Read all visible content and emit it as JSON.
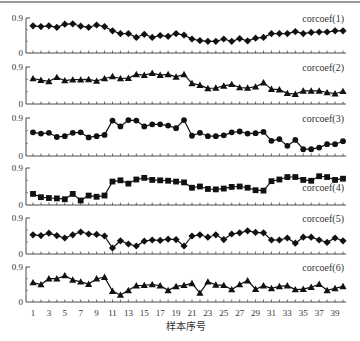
{
  "chart_data": {
    "type": "line",
    "xlabel": "样本序号",
    "x": [
      1,
      2,
      3,
      4,
      5,
      6,
      7,
      8,
      9,
      10,
      11,
      12,
      13,
      14,
      15,
      16,
      17,
      18,
      19,
      20,
      21,
      22,
      23,
      24,
      25,
      26,
      27,
      28,
      29,
      30,
      31,
      32,
      33,
      34,
      35,
      36,
      37,
      38,
      39,
      40
    ],
    "x_tick_labels": [
      "1",
      "3",
      "5",
      "7",
      "9",
      "11",
      "13",
      "15",
      "17",
      "19",
      "21",
      "23",
      "25",
      "27",
      "29",
      "31",
      "33",
      "35",
      "37",
      "39"
    ],
    "ylim": [
      0,
      0.9
    ],
    "y_tick_labels": [
      "0",
      "0.9"
    ],
    "grid": false,
    "layout": "6 stacked panels sharing x-axis",
    "series": [
      {
        "name": "corcoef(1)",
        "marker": "diamond",
        "values": [
          0.7,
          0.68,
          0.7,
          0.66,
          0.74,
          0.75,
          0.69,
          0.66,
          0.72,
          0.68,
          0.57,
          0.5,
          0.5,
          0.4,
          0.48,
          0.4,
          0.45,
          0.43,
          0.5,
          0.46,
          0.36,
          0.32,
          0.3,
          0.3,
          0.36,
          0.3,
          0.37,
          0.31,
          0.38,
          0.4,
          0.5,
          0.5,
          0.5,
          0.55,
          0.5,
          0.53,
          0.54,
          0.54,
          0.57,
          0.57
        ]
      },
      {
        "name": "corcoef(2)",
        "marker": "triangle",
        "values": [
          0.62,
          0.58,
          0.55,
          0.65,
          0.57,
          0.59,
          0.59,
          0.6,
          0.56,
          0.62,
          0.67,
          0.62,
          0.63,
          0.72,
          0.7,
          0.75,
          0.7,
          0.72,
          0.66,
          0.72,
          0.5,
          0.46,
          0.38,
          0.39,
          0.44,
          0.48,
          0.4,
          0.39,
          0.42,
          0.52,
          0.36,
          0.35,
          0.26,
          0.24,
          0.32,
          0.32,
          0.32,
          0.28,
          0.25,
          0.31
        ]
      },
      {
        "name": "corcoef(3)",
        "marker": "circle",
        "values": [
          0.56,
          0.53,
          0.55,
          0.45,
          0.47,
          0.55,
          0.56,
          0.44,
          0.47,
          0.5,
          0.84,
          0.7,
          0.85,
          0.84,
          0.7,
          0.75,
          0.75,
          0.72,
          0.66,
          0.85,
          0.48,
          0.55,
          0.47,
          0.47,
          0.49,
          0.56,
          0.58,
          0.53,
          0.54,
          0.57,
          0.36,
          0.4,
          0.24,
          0.38,
          0.16,
          0.16,
          0.2,
          0.28,
          0.28,
          0.35
        ]
      },
      {
        "name": "corcoef(4)",
        "marker": "square",
        "values": [
          0.27,
          0.19,
          0.17,
          0.16,
          0.14,
          0.27,
          0.11,
          0.23,
          0.2,
          0.23,
          0.57,
          0.6,
          0.52,
          0.62,
          0.66,
          0.61,
          0.6,
          0.59,
          0.57,
          0.55,
          0.42,
          0.45,
          0.39,
          0.38,
          0.4,
          0.44,
          0.45,
          0.42,
          0.36,
          0.35,
          0.58,
          0.62,
          0.68,
          0.68,
          0.61,
          0.59,
          0.7,
          0.68,
          0.61,
          0.64
        ]
      },
      {
        "name": "corcoef(5)",
        "marker": "diamond",
        "values": [
          0.48,
          0.46,
          0.52,
          0.46,
          0.4,
          0.48,
          0.55,
          0.5,
          0.49,
          0.45,
          0.15,
          0.33,
          0.25,
          0.2,
          0.32,
          0.35,
          0.34,
          0.37,
          0.36,
          0.2,
          0.45,
          0.48,
          0.42,
          0.48,
          0.36,
          0.5,
          0.53,
          0.58,
          0.54,
          0.53,
          0.35,
          0.35,
          0.4,
          0.27,
          0.42,
          0.42,
          0.35,
          0.29,
          0.4,
          0.33
        ]
      },
      {
        "name": "corcoef(6)",
        "marker": "triangle",
        "values": [
          0.5,
          0.45,
          0.6,
          0.6,
          0.68,
          0.57,
          0.52,
          0.46,
          0.6,
          0.64,
          0.28,
          0.18,
          0.3,
          0.42,
          0.43,
          0.45,
          0.42,
          0.3,
          0.4,
          0.43,
          0.48,
          0.23,
          0.52,
          0.44,
          0.43,
          0.32,
          0.45,
          0.55,
          0.33,
          0.42,
          0.35,
          0.4,
          0.42,
          0.32,
          0.33,
          0.38,
          0.46,
          0.3,
          0.35,
          0.4
        ]
      }
    ]
  }
}
